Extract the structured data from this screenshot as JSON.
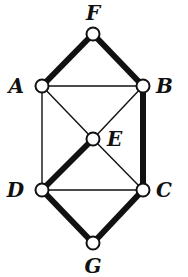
{
  "diagram": {
    "type": "graph",
    "nodes": [
      {
        "id": "F",
        "label": "F",
        "x": 93,
        "y": 34,
        "lx": 93,
        "ly": 20,
        "anchor": "middle"
      },
      {
        "id": "A",
        "label": "A",
        "x": 42,
        "y": 86,
        "lx": 24,
        "ly": 93,
        "anchor": "end"
      },
      {
        "id": "B",
        "label": "B",
        "x": 143,
        "y": 86,
        "lx": 156,
        "ly": 93,
        "anchor": "start"
      },
      {
        "id": "E",
        "label": "E",
        "x": 93,
        "y": 139,
        "lx": 107,
        "ly": 146,
        "anchor": "start"
      },
      {
        "id": "D",
        "label": "D",
        "x": 42,
        "y": 190,
        "lx": 24,
        "ly": 197,
        "anchor": "end"
      },
      {
        "id": "C",
        "label": "C",
        "x": 143,
        "y": 190,
        "lx": 156,
        "ly": 197,
        "anchor": "start"
      },
      {
        "id": "G",
        "label": "G",
        "x": 93,
        "y": 243,
        "lx": 93,
        "ly": 273,
        "anchor": "middle"
      }
    ],
    "edges": [
      {
        "from": "F",
        "to": "A",
        "bold": true
      },
      {
        "from": "F",
        "to": "B",
        "bold": true
      },
      {
        "from": "A",
        "to": "B",
        "bold": false
      },
      {
        "from": "A",
        "to": "D",
        "bold": false
      },
      {
        "from": "A",
        "to": "E",
        "bold": false
      },
      {
        "from": "B",
        "to": "E",
        "bold": false
      },
      {
        "from": "B",
        "to": "C",
        "bold": true
      },
      {
        "from": "E",
        "to": "D",
        "bold": true
      },
      {
        "from": "E",
        "to": "C",
        "bold": false
      },
      {
        "from": "D",
        "to": "C",
        "bold": false
      },
      {
        "from": "D",
        "to": "G",
        "bold": true
      },
      {
        "from": "C",
        "to": "G",
        "bold": true
      }
    ],
    "colors": {
      "stroke": "#111111",
      "node_fill": "#ffffff",
      "background": "#ffffff"
    }
  }
}
